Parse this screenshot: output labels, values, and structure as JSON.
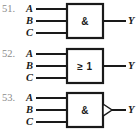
{
  "page": {
    "background_color": "#ffffff",
    "line_color": "#1a1a1a",
    "number_color": "#8b8b8b"
  },
  "diagram_set": {
    "title": "",
    "notation": "IEC rectangular logic gate symbols",
    "items": [
      {
        "number": "51.",
        "gate_symbol": "&",
        "gate_type": "AND",
        "negated_output": false,
        "inputs": [
          "A",
          "B",
          "C"
        ],
        "output": "Y"
      },
      {
        "number": "52.",
        "gate_symbol": "≥ 1",
        "gate_type": "OR",
        "negated_output": false,
        "inputs": [
          "A",
          "B",
          "C"
        ],
        "output": "Y"
      },
      {
        "number": "53.",
        "gate_symbol": "&",
        "gate_type": "NAND",
        "negated_output": true,
        "inputs": [
          "A",
          "B",
          "C"
        ],
        "output": "Y"
      }
    ]
  }
}
